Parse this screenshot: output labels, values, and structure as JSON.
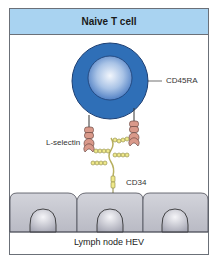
{
  "diagram": {
    "title": "Naive T cell",
    "labels": {
      "cd45ra": "CD45RA",
      "l_selectin": "L-selectin",
      "cd34": "CD34",
      "footer": "Lymph node HEV"
    },
    "colors": {
      "header_bg": "#a9d3f1",
      "cell_outer": "#2e6db4",
      "cell_inner_light": "#dde9f7",
      "selectin": "#d9998a",
      "cd34_beads": "#eee88a",
      "endothelium": "#c5c6cf",
      "frame": "#6b7078"
    },
    "endothelial_cells": 3
  }
}
